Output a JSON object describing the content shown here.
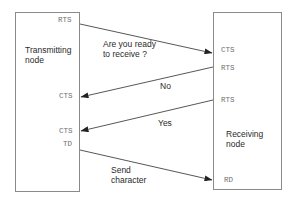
{
  "nodes": {
    "transmitting": {
      "title_line1": "Transmitting",
      "title_line2": "node",
      "signals": {
        "rts": "RTS",
        "cts_no": "CTS",
        "cts_yes": "CTS",
        "td": "TD"
      }
    },
    "receiving": {
      "title_line1": "Receiving",
      "title_line2": "node",
      "signals": {
        "cts": "CTS",
        "rts_no": "RTS",
        "rts_yes": "RTS",
        "rd": "RD"
      }
    }
  },
  "messages": [
    {
      "line1": "Are you ready",
      "line2": "to receive ?",
      "from": "transmitting.RTS",
      "to": "receiving.CTS"
    },
    {
      "line1": "No",
      "line2": "",
      "from": "receiving.RTS",
      "to": "transmitting.CTS"
    },
    {
      "line1": "Yes",
      "line2": "",
      "from": "receiving.RTS",
      "to": "transmitting.CTS"
    },
    {
      "line1": "Send",
      "line2": "character",
      "from": "transmitting.TD",
      "to": "receiving.RD"
    }
  ],
  "colors": {
    "box_border": "#8a8a8a",
    "arrow": "#333333",
    "signal_text": "#6e6e6e",
    "label_text": "#2a2a2a"
  }
}
